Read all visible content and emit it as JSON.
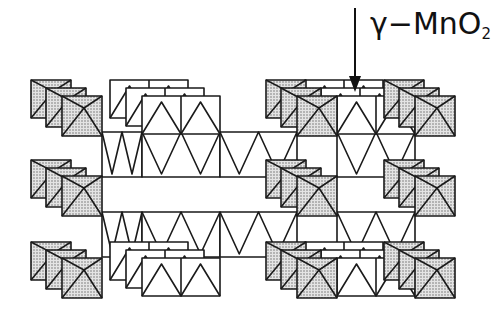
{
  "diagram": {
    "label": {
      "greek": "γ",
      "dash": "−",
      "formula_main": "MnO",
      "formula_sub": "2"
    },
    "arrow": {
      "x": 355,
      "y1": 8,
      "y2": 92
    },
    "colors": {
      "stroke": "#1a1a1a",
      "shaded_fill": "#cfcfcf",
      "white_fill": "#ffffff"
    },
    "shaded_columns_x": [
      62,
      297,
      415
    ],
    "rows_y": [
      96,
      176,
      258
    ],
    "cell_size": 40,
    "white_blocks_x": [
      142,
      337
    ],
    "white_block_width": 78
  }
}
